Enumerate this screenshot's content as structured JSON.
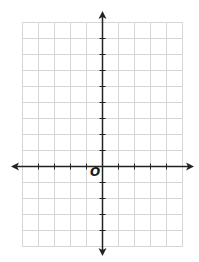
{
  "diagram": {
    "type": "coordinate-plane",
    "origin_label": "O",
    "grid": {
      "columns": 10,
      "rows": 14,
      "cell_size_px": 16,
      "columns_left_of_y_axis": 5,
      "columns_right_of_y_axis": 5,
      "rows_above_x_axis": 9,
      "rows_below_x_axis": 5,
      "line_color": "#d6d6d6"
    },
    "axes": {
      "color": "#222222",
      "x_axis_arrows": [
        "left",
        "right"
      ],
      "y_axis_arrows": [
        "up",
        "down"
      ],
      "tick_marks": true
    }
  }
}
